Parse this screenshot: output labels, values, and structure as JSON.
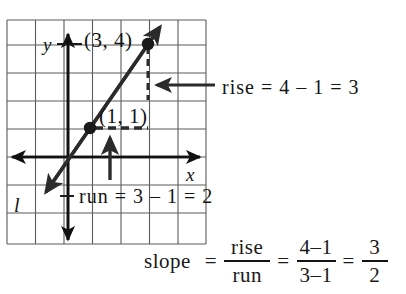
{
  "figure": {
    "grid": {
      "columns": 7,
      "rows": 8,
      "cell_width": 28.5,
      "cell_height": 28,
      "left": 7,
      "top": 20,
      "right": 206,
      "bottom": 244,
      "color": "#555555"
    },
    "axes": {
      "x_label": "x",
      "y_label": "y",
      "origin_x": 68,
      "origin_y": 157,
      "color": "#111111"
    },
    "line": {
      "label": "l",
      "color": "#2b2b2b",
      "slope": 1.5
    },
    "points": [
      {
        "label": "(3, 4)",
        "x": 3,
        "y": 4,
        "px": 148,
        "py": 44
      },
      {
        "label": "(1, 1)",
        "x": 1,
        "y": 1,
        "px": 90,
        "py": 128
      }
    ],
    "annotations": {
      "rise_arrow": "left-arrow-icon",
      "run_arrow": "up-arrow-icon",
      "rise_dashed_segment": "vertical-dashed-rise",
      "run_dashed_segment": "horizontal-dashed-run"
    }
  },
  "equations": {
    "rise": "rise  =  4  –  1  =  3",
    "run": "run  =  3  –  1  =  2",
    "slope": {
      "word": "slope",
      "equals_1": "=",
      "frac1_num": "rise",
      "frac1_den": "run",
      "equals_2": "=",
      "frac2_num": "4–1",
      "frac2_den": "3–1",
      "equals_3": "=",
      "frac3_num": "3",
      "frac3_den": "2"
    }
  }
}
